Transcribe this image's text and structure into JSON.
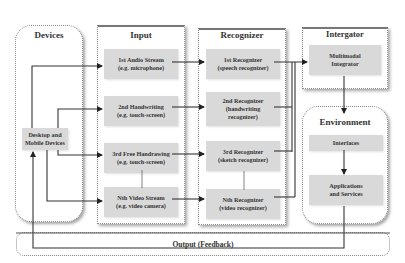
{
  "diagram": {
    "panels": {
      "devices": {
        "title": "Devices"
      },
      "input": {
        "title": "Input"
      },
      "recognizer": {
        "title": "Recognizer"
      },
      "integrator": {
        "title": "Intergator"
      },
      "environment": {
        "title": "Environment"
      }
    },
    "devices_node": {
      "line1": "Desktop and",
      "line2": "Mobile Devices"
    },
    "inputs": [
      {
        "line1": "1st Audio Stream",
        "line2": "(e.g. microphone)"
      },
      {
        "line1": "2nd Handwriting",
        "line2": "(e.g. touch-screen)"
      },
      {
        "line1": "3rd Free Handrawing",
        "line2": "(e.g. touch-screen)"
      },
      {
        "line1": "Nth Video Stream",
        "line2": "(e.g. video camera)"
      }
    ],
    "recognizers": [
      {
        "line1": "1st Recognizer",
        "line2": "(speech recognizer)",
        "line3": ""
      },
      {
        "line1": "2nd Recognizer",
        "line2": "(handwriting",
        "line3": "recognizer)"
      },
      {
        "line1": "3rd Recognizer",
        "line2": "(sketch recognizer)",
        "line3": ""
      },
      {
        "line1": "Nth Recognizer",
        "line2": "(video recognizer)",
        "line3": ""
      }
    ],
    "integrator_node": {
      "line1": "Multimodal",
      "line2": "Integrator"
    },
    "environment_nodes": [
      {
        "line1": "Interfaces",
        "line2": ""
      },
      {
        "line1": "Applications",
        "line2": "and Services"
      }
    ],
    "output": {
      "label": "Output (Feedback)"
    },
    "colors": {
      "node_fill": "#d9d9d9",
      "line": "#333333",
      "border": "#8a8a8a"
    }
  }
}
